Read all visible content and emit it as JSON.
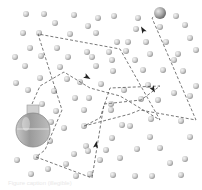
{
  "diagram": {
    "colors": {
      "background": "#ffffff",
      "molecule_light": "#e6e6e6",
      "molecule_dark": "#9a9a9a",
      "path": "#555555",
      "arrow": "#222222",
      "flask_glass": "#bdbdbd",
      "flask_liquid": "#8f8f8f",
      "target_particle": "#9c9c9c"
    },
    "flask": {
      "cx": 33,
      "cy": 130,
      "r": 17,
      "neck_x": 27,
      "neck_y": 105,
      "neck_w": 12,
      "neck_h": 9
    },
    "target_particle": {
      "cx": 160,
      "cy": 13,
      "r": 6
    },
    "molecules": [
      [
        26,
        14
      ],
      [
        44,
        14
      ],
      [
        74,
        15
      ],
      [
        98,
        18
      ],
      [
        114,
        16
      ],
      [
        138,
        18
      ],
      [
        176,
        16
      ],
      [
        55,
        23
      ],
      [
        88,
        26
      ],
      [
        136,
        29
      ],
      [
        160,
        27
      ],
      [
        185,
        25
      ],
      [
        23,
        33
      ],
      [
        39,
        33
      ],
      [
        70,
        34
      ],
      [
        96,
        33
      ],
      [
        117,
        42
      ],
      [
        128,
        42
      ],
      [
        146,
        42
      ],
      [
        166,
        42
      ],
      [
        190,
        38
      ],
      [
        30,
        48
      ],
      [
        57,
        48
      ],
      [
        87,
        52
      ],
      [
        109,
        52
      ],
      [
        126,
        51
      ],
      [
        150,
        54
      ],
      [
        178,
        54
      ],
      [
        196,
        50
      ],
      [
        15,
        57
      ],
      [
        41,
        56
      ],
      [
        68,
        57
      ],
      [
        92,
        57
      ],
      [
        112,
        60
      ],
      [
        135,
        60
      ],
      [
        174,
        60
      ],
      [
        25,
        66
      ],
      [
        60,
        67
      ],
      [
        96,
        66
      ],
      [
        113,
        71
      ],
      [
        143,
        70
      ],
      [
        163,
        70
      ],
      [
        183,
        71
      ],
      [
        40,
        78
      ],
      [
        67,
        79
      ],
      [
        80,
        82
      ],
      [
        101,
        84
      ],
      [
        124,
        90
      ],
      [
        148,
        85
      ],
      [
        196,
        86
      ],
      [
        16,
        83
      ],
      [
        28,
        90
      ],
      [
        54,
        91
      ],
      [
        89,
        98
      ],
      [
        141,
        99
      ],
      [
        174,
        93
      ],
      [
        42,
        104
      ],
      [
        75,
        98
      ],
      [
        56,
        111
      ],
      [
        84,
        110
      ],
      [
        111,
        104
      ],
      [
        158,
        100
      ],
      [
        190,
        96
      ],
      [
        51,
        122
      ],
      [
        64,
        128
      ],
      [
        84,
        126
      ],
      [
        111,
        110
      ],
      [
        122,
        125
      ],
      [
        151,
        119
      ],
      [
        181,
        121
      ],
      [
        50,
        141
      ],
      [
        86,
        146
      ],
      [
        112,
        138
      ],
      [
        130,
        126
      ],
      [
        150,
        137
      ],
      [
        190,
        137
      ],
      [
        17,
        160
      ],
      [
        36,
        157
      ],
      [
        74,
        154
      ],
      [
        88,
        151
      ],
      [
        106,
        150
      ],
      [
        137,
        149
      ],
      [
        160,
        148
      ],
      [
        170,
        163
      ],
      [
        185,
        159
      ],
      [
        31,
        174
      ],
      [
        48,
        169
      ],
      [
        66,
        164
      ],
      [
        76,
        176
      ],
      [
        90,
        174
      ],
      [
        113,
        175
      ],
      [
        135,
        176
      ],
      [
        152,
        176
      ],
      [
        181,
        175
      ],
      [
        100,
        160
      ],
      [
        120,
        158
      ]
    ],
    "path_points": [
      [
        32,
        104
      ],
      [
        40,
        86
      ],
      [
        64,
        72
      ],
      [
        90,
        88
      ],
      [
        120,
        96
      ],
      [
        160,
        120
      ],
      [
        120,
        49
      ],
      [
        38,
        34
      ],
      [
        62,
        110
      ],
      [
        45,
        150
      ],
      [
        36,
        157
      ],
      [
        92,
        178
      ],
      [
        104,
        104
      ],
      [
        141,
        100
      ],
      [
        160,
        86
      ],
      [
        110,
        88
      ],
      [
        100,
        118
      ],
      [
        84,
        126
      ],
      [
        130,
        114
      ],
      [
        140,
        110
      ],
      [
        196,
        120
      ],
      [
        152,
        18
      ],
      [
        160,
        13
      ]
    ],
    "arrows": [
      {
        "x": 87,
        "y": 77,
        "angle": 30
      },
      {
        "x": 143,
        "y": 30,
        "angle": -120
      },
      {
        "x": 153,
        "y": 89,
        "angle": 60
      },
      {
        "x": 96,
        "y": 145,
        "angle": -80
      }
    ],
    "caption": "Figure caption (illegible)"
  }
}
